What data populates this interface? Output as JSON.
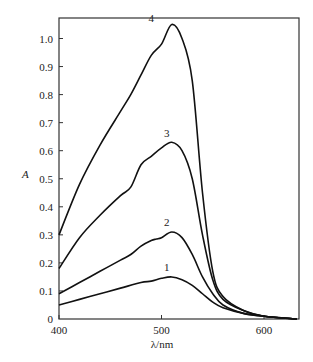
{
  "chart_data": {
    "type": "line",
    "title": "",
    "xlabel": "λ/nm",
    "ylabel": "A",
    "xlim": [
      400,
      632
    ],
    "ylim": [
      0,
      1.08
    ],
    "grid": false,
    "x_ticks": [
      "400",
      "500",
      "600"
    ],
    "y_ticks": [
      "0",
      "0.1",
      "0.2",
      "0.3",
      "0.4",
      "0.5",
      "0.6",
      "0.7",
      "0.8",
      "0.9",
      "1.0"
    ],
    "series": [
      {
        "name": "1",
        "x": [
          400,
          420,
          440,
          460,
          480,
          490,
          500,
          510,
          520,
          530,
          540,
          550,
          560,
          580,
          600,
          632
        ],
        "y": [
          0.05,
          0.07,
          0.09,
          0.11,
          0.13,
          0.135,
          0.145,
          0.15,
          0.14,
          0.12,
          0.09,
          0.06,
          0.04,
          0.02,
          0.01,
          0.0
        ]
      },
      {
        "name": "2",
        "x": [
          400,
          420,
          440,
          460,
          470,
          480,
          490,
          495,
          500,
          510,
          520,
          530,
          540,
          550,
          560,
          580,
          600,
          632
        ],
        "y": [
          0.09,
          0.13,
          0.17,
          0.21,
          0.23,
          0.26,
          0.28,
          0.285,
          0.29,
          0.31,
          0.29,
          0.23,
          0.15,
          0.09,
          0.05,
          0.02,
          0.01,
          0.0
        ]
      },
      {
        "name": "3",
        "x": [
          400,
          420,
          440,
          460,
          470,
          480,
          490,
          500,
          510,
          520,
          530,
          540,
          550,
          560,
          580,
          600,
          632
        ],
        "y": [
          0.18,
          0.29,
          0.37,
          0.44,
          0.47,
          0.55,
          0.58,
          0.61,
          0.63,
          0.6,
          0.5,
          0.3,
          0.14,
          0.07,
          0.03,
          0.01,
          0.0
        ]
      },
      {
        "name": "4",
        "x": [
          400,
          420,
          440,
          460,
          470,
          480,
          490,
          500,
          510,
          520,
          530,
          540,
          550,
          560,
          580,
          600,
          632
        ],
        "y": [
          0.3,
          0.48,
          0.62,
          0.74,
          0.8,
          0.87,
          0.94,
          0.98,
          1.05,
          1.0,
          0.85,
          0.45,
          0.17,
          0.08,
          0.03,
          0.01,
          0.0
        ]
      }
    ],
    "annotations": [
      {
        "text": "1",
        "x": 505,
        "y": 0.17
      },
      {
        "text": "2",
        "x": 505,
        "y": 0.33
      },
      {
        "text": "3",
        "x": 505,
        "y": 0.65
      },
      {
        "text": "4",
        "x": 490,
        "y": 1.06
      }
    ]
  }
}
